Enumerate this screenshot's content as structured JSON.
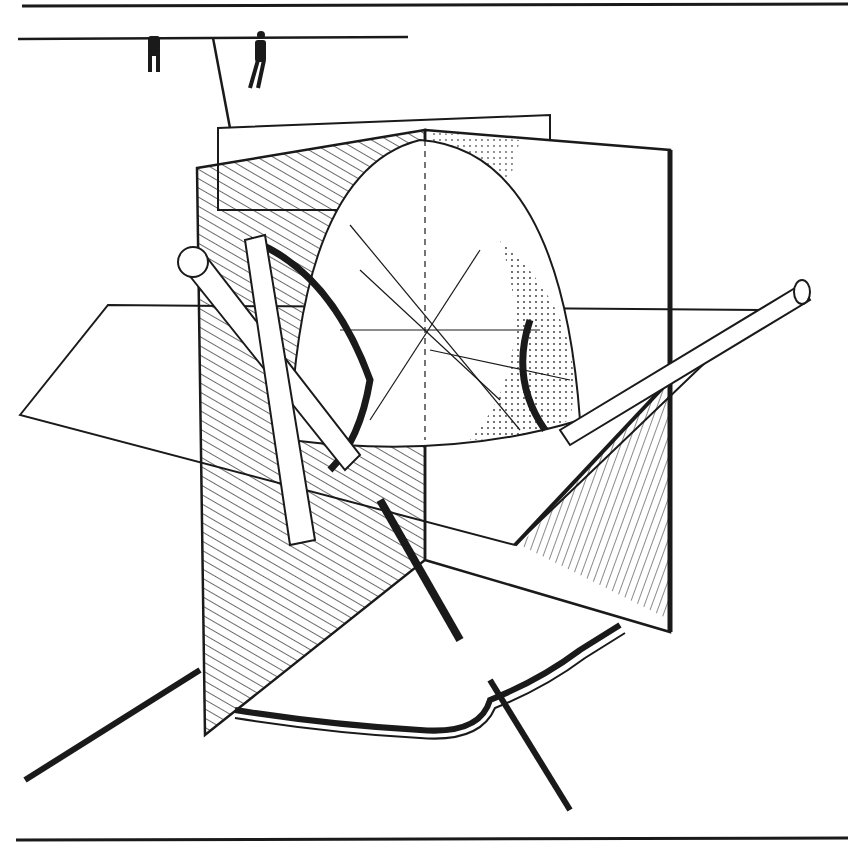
{
  "illustration": {
    "subject": "pen-and-ink drawing of intersecting planes with hemisphere and tubes",
    "colors": {
      "ink": "#1a1a1a",
      "paper": "#ffffff"
    }
  }
}
